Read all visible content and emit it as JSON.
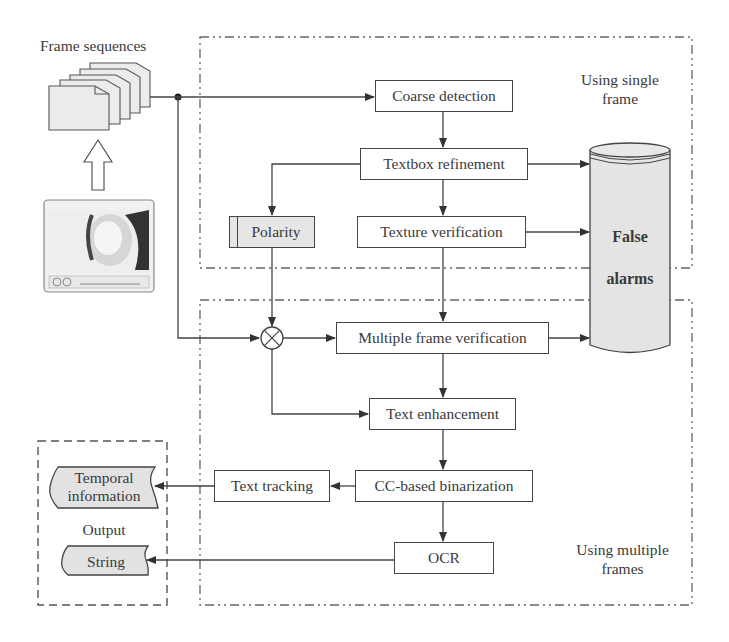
{
  "title_label": "Frame sequences",
  "regions": {
    "single": {
      "line1": "Using single",
      "line2": "frame"
    },
    "multiple": {
      "line1": "Using multiple",
      "line2": "frames"
    }
  },
  "nodes": {
    "coarse_detection": "Coarse detection",
    "textbox_refinement": "Textbox refinement",
    "polarity": "Polarity",
    "texture_verification": "Texture verification",
    "multiple_frame_verification": "Multiple frame verification",
    "text_enhancement": "Text enhancement",
    "text_tracking": "Text tracking",
    "cc_binarization": "CC-based binarization",
    "ocr": "OCR"
  },
  "false_alarms": {
    "line1": "False",
    "line2": "alarms"
  },
  "output": {
    "label": "Output",
    "temporal_line1": "Temporal",
    "temporal_line2": "information",
    "string": "String"
  },
  "icons": {
    "frame_stack": "stacked-document-frames-icon",
    "video_thumbnail": "video-player-thumbnail",
    "up_arrow": "hollow-up-arrow-icon",
    "multiplier": "circled-times-icon",
    "database": "cylinder-storage-icon"
  },
  "colors": {
    "line": "#444444",
    "box_fill": "#ffffff",
    "shaded_fill": "#e6e6e6",
    "text": "#3a3a3a"
  }
}
